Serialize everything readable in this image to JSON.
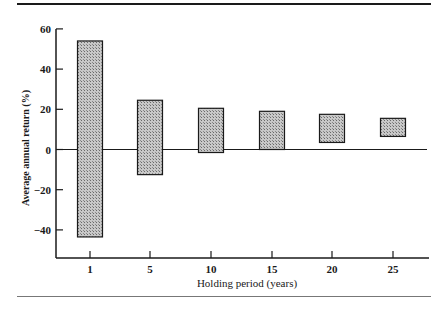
{
  "chart_data": {
    "type": "bar",
    "subtype": "floating-range",
    "title": "",
    "xlabel": "Holding period (years)",
    "ylabel": "Average annual return (%)",
    "categories": [
      "1",
      "5",
      "10",
      "15",
      "20",
      "25"
    ],
    "series": [
      {
        "name": "Maximum",
        "values": [
          54,
          24.5,
          20.5,
          19,
          17.5,
          15.5
        ]
      },
      {
        "name": "Minimum",
        "values": [
          -43.5,
          -12.5,
          -1.5,
          0,
          3.5,
          6.5
        ]
      }
    ],
    "ylim": [
      -53,
      62
    ],
    "yticks": [
      60,
      40,
      20,
      0,
      -20,
      -40
    ],
    "ytick_labels": [
      "60",
      "40",
      "20",
      "0",
      "−20",
      "−40"
    ],
    "grid": false,
    "legend": null,
    "bar_fill": "#a8a8a8",
    "bar_edge": "#1a1a1a"
  }
}
